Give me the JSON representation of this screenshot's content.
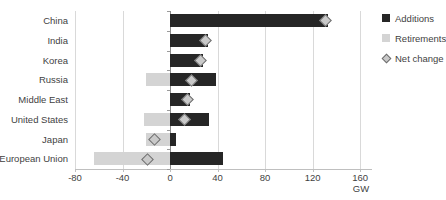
{
  "chart_data": {
    "type": "bar",
    "orientation": "horizontal",
    "title": "",
    "xlabel": "GW",
    "ylabel": "",
    "xlim": [
      -80,
      170
    ],
    "grid": true,
    "legend_position": "right",
    "categories": [
      "China",
      "India",
      "Korea",
      "Russia",
      "Middle East",
      "United States",
      "Japan",
      "European Union"
    ],
    "series": [
      {
        "name": "Additions",
        "values": [
          133,
          32,
          28,
          39,
          17,
          33,
          5,
          45
        ]
      },
      {
        "name": "Retirements",
        "values": [
          0,
          0,
          0,
          -20,
          0,
          -22,
          -20,
          -64
        ]
      },
      {
        "name": "Net change",
        "values": [
          131,
          30,
          26,
          18,
          15,
          12,
          -13,
          -19
        ]
      }
    ],
    "ticks": [
      -80,
      -40,
      0,
      40,
      80,
      120,
      160
    ],
    "tick_labels": [
      "-80",
      "-40",
      "0",
      "40",
      "80",
      "120",
      "160"
    ]
  },
  "legend": {
    "items": [
      {
        "label": "Additions",
        "swatch": "square-black",
        "color": "#262626"
      },
      {
        "label": "Retirements",
        "swatch": "square-gray",
        "color": "#d4d4d4"
      },
      {
        "label": "Net change",
        "swatch": "diamond-marker",
        "color": "#c9c9c9"
      }
    ]
  },
  "axis": {
    "unit_label": "GW"
  },
  "colors": {
    "additions": "#262626",
    "retirements": "#d4d4d4",
    "net_change_fill": "#c9c9c9",
    "net_change_stroke": "#6e6e6e",
    "gridline": "#d9d9d9",
    "zero_line": "#8c8c8c",
    "text": "#3f3f3f"
  }
}
